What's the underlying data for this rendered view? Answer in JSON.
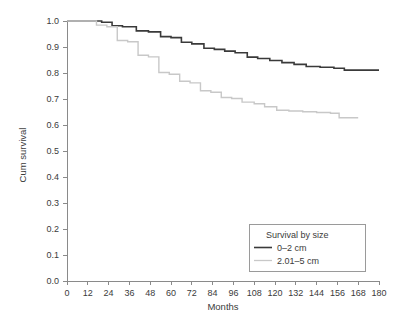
{
  "chart_data": {
    "type": "line",
    "title": "",
    "xlabel": "Months",
    "ylabel": "Cum survival",
    "xlim": [
      0,
      180
    ],
    "ylim": [
      0.0,
      1.0
    ],
    "grid": false,
    "step_interpolation": "post",
    "xticks": [
      0,
      12,
      24,
      36,
      48,
      60,
      72,
      84,
      96,
      108,
      120,
      132,
      144,
      156,
      168,
      180
    ],
    "xtick_labels": [
      "0",
      "12",
      "24",
      "36",
      "48",
      "60",
      "72",
      "84",
      "96",
      "108",
      "120",
      "132",
      "144",
      "156",
      "168",
      "180"
    ],
    "yticks": [
      0.0,
      0.1,
      0.2,
      0.3,
      0.4,
      0.5,
      0.6,
      0.7,
      0.8,
      0.9,
      1.0
    ],
    "ytick_labels": [
      "0.0",
      "0.1",
      "0.2",
      "0.3",
      "0.4",
      "0.5",
      "0.6",
      "0.7",
      "0.8",
      "0.9",
      "1.0"
    ],
    "legend_position": "lower right",
    "legend_title": "Survival by size",
    "series": [
      {
        "name": "0–2 cm",
        "color": "#3a3a3a",
        "width": 1.6,
        "x": [
          0,
          14,
          20,
          26,
          32,
          40,
          47,
          54,
          60,
          66,
          72,
          79,
          85,
          91,
          97,
          104,
          110,
          117,
          124,
          131,
          138,
          146,
          154,
          160,
          168,
          180
        ],
        "y": [
          1.0,
          1.0,
          0.995,
          0.982,
          0.978,
          0.962,
          0.958,
          0.94,
          0.936,
          0.918,
          0.912,
          0.895,
          0.891,
          0.884,
          0.878,
          0.861,
          0.856,
          0.848,
          0.84,
          0.833,
          0.825,
          0.822,
          0.818,
          0.811,
          0.811,
          0.811
        ]
      },
      {
        "name": "2.01–5 cm",
        "color": "#c8c8c8",
        "width": 1.4,
        "x": [
          0,
          11,
          17,
          23,
          29,
          35,
          41,
          47,
          53,
          59,
          65,
          71,
          77,
          83,
          89,
          95,
          101,
          108,
          114,
          121,
          128,
          136,
          144,
          152,
          157,
          168
        ],
        "y": [
          1.0,
          1.0,
          0.984,
          0.978,
          0.925,
          0.92,
          0.868,
          0.862,
          0.802,
          0.795,
          0.768,
          0.762,
          0.732,
          0.726,
          0.706,
          0.702,
          0.688,
          0.682,
          0.67,
          0.657,
          0.654,
          0.651,
          0.648,
          0.645,
          0.628,
          0.628
        ]
      }
    ]
  },
  "axes": {
    "x_axis_label": "Months",
    "y_axis_label": "Cum survival"
  },
  "legend": {
    "title": "Survival by size",
    "entries": [
      {
        "label": "0–2 cm",
        "color": "#3a3a3a"
      },
      {
        "label": "2.01–5 cm",
        "color": "#c8c8c8"
      }
    ]
  },
  "colors": {
    "background": "#ffffff",
    "axis": "#8a8a8a",
    "text": "#3b3b3b",
    "series_dark": "#3a3a3a",
    "series_light": "#c8c8c8",
    "legend_border": "#9a9a9a"
  }
}
